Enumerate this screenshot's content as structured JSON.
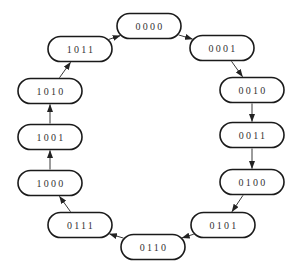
{
  "diagram": {
    "type": "state-cycle",
    "colors": {
      "stroke": "#1a1a1a",
      "text": "#333333",
      "background": "#ffffff"
    },
    "nodes": [
      {
        "id": "n0",
        "label": "0000",
        "cx": 149,
        "cy": 26
      },
      {
        "id": "n1",
        "label": "0001",
        "cx": 222,
        "cy": 48
      },
      {
        "id": "n2",
        "label": "0010",
        "cx": 252,
        "cy": 90
      },
      {
        "id": "n3",
        "label": "0011",
        "cx": 252,
        "cy": 135
      },
      {
        "id": "n4",
        "label": "0100",
        "cx": 252,
        "cy": 182
      },
      {
        "id": "n5",
        "label": "0101",
        "cx": 223,
        "cy": 225
      },
      {
        "id": "n6",
        "label": "0110",
        "cx": 153,
        "cy": 247
      },
      {
        "id": "n7",
        "label": "0111",
        "cx": 80,
        "cy": 225
      },
      {
        "id": "n8",
        "label": "1000",
        "cx": 50,
        "cy": 183
      },
      {
        "id": "n9",
        "label": "1001",
        "cx": 50,
        "cy": 137
      },
      {
        "id": "n10",
        "label": "1010",
        "cx": 50,
        "cy": 91
      },
      {
        "id": "n11",
        "label": "1011",
        "cx": 80,
        "cy": 49
      }
    ],
    "edges": [
      {
        "from": "n0",
        "to": "n1"
      },
      {
        "from": "n1",
        "to": "n2"
      },
      {
        "from": "n2",
        "to": "n3"
      },
      {
        "from": "n3",
        "to": "n4"
      },
      {
        "from": "n4",
        "to": "n5"
      },
      {
        "from": "n5",
        "to": "n6"
      },
      {
        "from": "n6",
        "to": "n7"
      },
      {
        "from": "n7",
        "to": "n8"
      },
      {
        "from": "n8",
        "to": "n9"
      },
      {
        "from": "n9",
        "to": "n10"
      },
      {
        "from": "n10",
        "to": "n11"
      },
      {
        "from": "n11",
        "to": "n0"
      }
    ]
  }
}
